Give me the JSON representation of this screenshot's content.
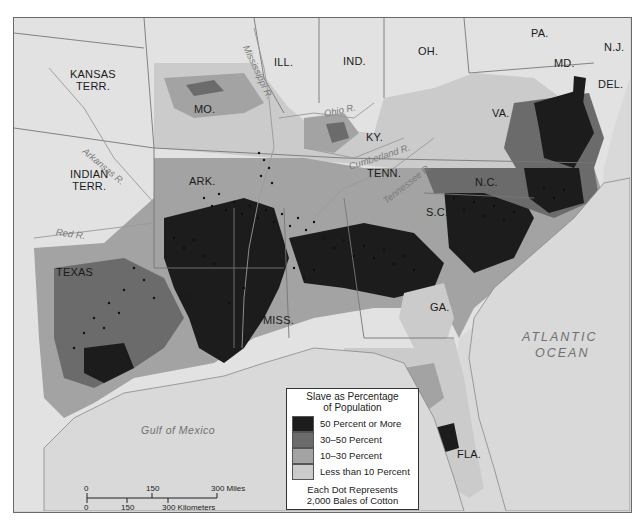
{
  "map": {
    "subject": "Slavery and cotton production in the American South, c. 1860",
    "colors": {
      "background_land_free": "#e2e2e2",
      "water": "#d9d9d9",
      "frame": "#6a6a6a",
      "class_50_plus": "#1c1c1c",
      "class_30_50": "#6b6b6b",
      "class_10_30": "#a3a3a3",
      "class_under_10": "#cbcbcb",
      "dot": "#111111",
      "border": "#777777"
    },
    "state_labels": [
      {
        "id": "kansas",
        "text": "KANSAS\nTERR."
      },
      {
        "id": "indian",
        "text": "INDIAN\nTERR."
      },
      {
        "id": "texas",
        "text": "TEXAS"
      },
      {
        "id": "mo",
        "text": "MO."
      },
      {
        "id": "ill",
        "text": "ILL."
      },
      {
        "id": "ind",
        "text": "IND."
      },
      {
        "id": "oh",
        "text": "OH."
      },
      {
        "id": "pa",
        "text": "PA."
      },
      {
        "id": "nj",
        "text": "N.J."
      },
      {
        "id": "md",
        "text": "MD."
      },
      {
        "id": "del",
        "text": "DEL."
      },
      {
        "id": "va",
        "text": "VA."
      },
      {
        "id": "ky",
        "text": "KY."
      },
      {
        "id": "tenn",
        "text": "TENN."
      },
      {
        "id": "nc",
        "text": "N.C."
      },
      {
        "id": "sc",
        "text": "S.C."
      },
      {
        "id": "ark",
        "text": "ARK."
      },
      {
        "id": "la",
        "text": "LA."
      },
      {
        "id": "miss",
        "text": "MISS."
      },
      {
        "id": "ala",
        "text": "ALA."
      },
      {
        "id": "ga",
        "text": "GA."
      },
      {
        "id": "fla",
        "text": "FLA."
      }
    ],
    "river_labels": [
      {
        "id": "mississippi",
        "text": "Mississippi R."
      },
      {
        "id": "ohio",
        "text": "Ohio R."
      },
      {
        "id": "arkansas",
        "text": "Arkansas R."
      },
      {
        "id": "red",
        "text": "Red R."
      },
      {
        "id": "cumberland",
        "text": "Cumberland R."
      },
      {
        "id": "tennessee",
        "text": "Tennessee R."
      }
    ],
    "water_labels": {
      "gulf": "Gulf of Mexico",
      "atlantic_line1": "ATLANTIC",
      "atlantic_line2": "OCEAN"
    }
  },
  "legend": {
    "title_line1": "Slave as Percentage",
    "title_line2": "of Population",
    "classes": [
      {
        "label": "50 Percent or More",
        "color": "#1c1c1c"
      },
      {
        "label": "30–50 Percent",
        "color": "#6b6b6b"
      },
      {
        "label": "10–30 Percent",
        "color": "#a3a3a3"
      },
      {
        "label": "Less than 10 Percent",
        "color": "#cbcbcb"
      }
    ],
    "footnote_line1": "Each Dot Represents",
    "footnote_line2": "2,000 Bales of Cotton"
  },
  "scale_bar": {
    "miles": {
      "ticks": [
        "0",
        "150",
        "300 Miles"
      ]
    },
    "kilometers": {
      "ticks": [
        "0",
        "150",
        "300 Kilometers"
      ]
    }
  }
}
